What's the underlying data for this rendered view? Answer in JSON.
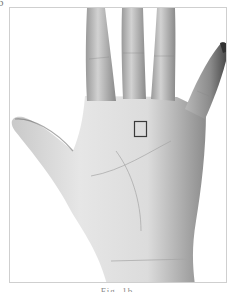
{
  "figure": {
    "panel_label": "b",
    "marker": {
      "shape": "square",
      "x": 133,
      "y": 120,
      "width": 13,
      "height": 16,
      "color": "#3a3a3a"
    },
    "caption": "Fig. 1b"
  }
}
